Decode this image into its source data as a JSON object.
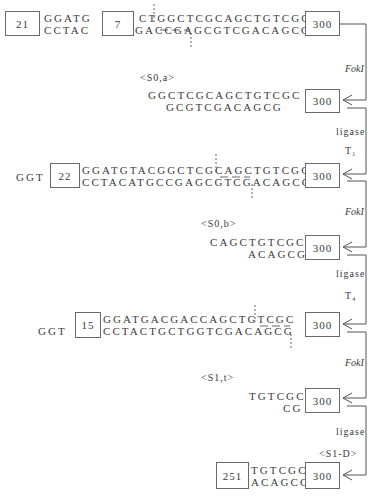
{
  "diagram": {
    "title": "",
    "steps": [
      {
        "id": "row1",
        "left_boxes": [
          "21",
          "7"
        ],
        "left_top": "GGATG",
        "left_bottom": "CCTAC",
        "top": "CTGGCTCGCAGCTGTCGC",
        "bottom": "GACCGAGCGTCGACAGCG",
        "right_box": "300"
      },
      {
        "id": "row2",
        "label": "<S0,a>",
        "top": "GGCTCGCAGCTGTCGC",
        "bottom": "GCGTCGACAGCG",
        "right_box": "300"
      },
      {
        "id": "row3",
        "prefix": "GGT",
        "left_box": "22",
        "top": "GGATGTACGGCTCGCAGCTGTCGC",
        "bottom": "CCTACATGCCGAGCGTCGACAGCG",
        "right_box": "300"
      },
      {
        "id": "row4",
        "label": "<S0,b>",
        "top": "CAGCTGTCGC",
        "bottom": "ACAGCG",
        "right_box": "300"
      },
      {
        "id": "row5",
        "prefix": "GGT",
        "left_box": "15",
        "top": "GGATGACGACCAGCTGTCGC",
        "bottom": "CCTACTGCTGGTCGACAGCG",
        "right_box": "300"
      },
      {
        "id": "row6",
        "label": "<S1,t>",
        "top": "TGTCGC",
        "bottom": "CG",
        "right_box": "300"
      },
      {
        "id": "row7",
        "left_box": "251",
        "top": "TGTCGC",
        "bottom": "ACAGCG",
        "right_box": "300"
      }
    ],
    "transitions": [
      {
        "label": "FokI",
        "italic": true
      },
      {
        "label": "ligase",
        "sub_label": "T₁"
      },
      {
        "label": "FokI",
        "italic": true
      },
      {
        "label": "ligase",
        "sub_label": "T₄"
      },
      {
        "label": "FokI",
        "italic": true
      },
      {
        "label": "ligase",
        "sub_label": "<S1-D>"
      }
    ]
  }
}
